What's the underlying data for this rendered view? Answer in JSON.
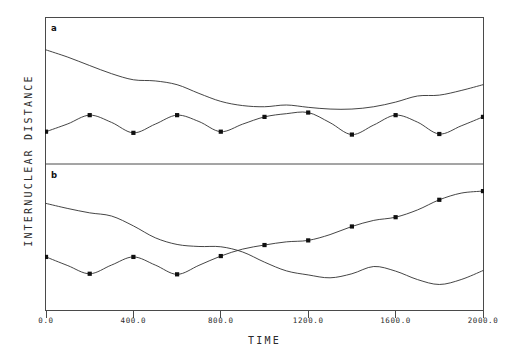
{
  "figure": {
    "background_color": "#ffffff",
    "line_color": "#303030",
    "marker_color": "#101010"
  },
  "axes": {
    "x_title": "TIME",
    "y_title": "INTERNUCLEAR DISTANCE",
    "x_tick_labels": [
      "0.0",
      "400.0",
      "800.0",
      "1200.0",
      "1600.0",
      "2000.0"
    ],
    "x_tick_values": [
      0,
      400,
      800,
      1200,
      1600,
      2000
    ],
    "y_tick_labels": []
  },
  "panels": [
    {
      "tag": "a"
    },
    {
      "tag": "b"
    }
  ],
  "chart_data": {
    "type": "line",
    "title": "",
    "xlabel": "TIME",
    "ylabel": "INTERNUCLEAR DISTANCE",
    "xlim": [
      0,
      2000
    ],
    "ylim": [
      0,
      1
    ],
    "grid": false,
    "legend": "none",
    "panel_layout": "2 stacked panels sharing one frame, divider between them",
    "marker_style": "filled square",
    "panels": [
      {
        "tag": "a",
        "series": [
          {
            "name": "panel-a-upper-curve",
            "markers": false,
            "x": [
              0,
              100,
              200,
              300,
              400,
              500,
              600,
              700,
              800,
              900,
              1000,
              1100,
              1200,
              1300,
              1400,
              1500,
              1600,
              1700,
              1800,
              1900,
              2000
            ],
            "y": [
              0.78,
              0.73,
              0.672,
              0.616,
              0.574,
              0.566,
              0.54,
              0.48,
              0.425,
              0.396,
              0.388,
              0.4,
              0.384,
              0.372,
              0.372,
              0.388,
              0.42,
              0.462,
              0.468,
              0.5,
              0.54
            ]
          },
          {
            "name": "panel-a-oscillating-curve",
            "markers": true,
            "x": [
              0,
              100,
              200,
              300,
              400,
              500,
              600,
              700,
              800,
              900,
              1000,
              1100,
              1200,
              1300,
              1400,
              1500,
              1600,
              1700,
              1800,
              1900,
              2000
            ],
            "y": [
              0.216,
              0.27,
              0.33,
              0.28,
              0.208,
              0.268,
              0.33,
              0.286,
              0.216,
              0.268,
              0.318,
              0.34,
              0.348,
              0.278,
              0.196,
              0.262,
              0.33,
              0.282,
              0.2,
              0.256,
              0.318
            ],
            "marker_x": [
              0,
              200,
              400,
              600,
              800,
              1000,
              1200,
              1400,
              1600,
              1800,
              2000
            ],
            "marker_y": [
              0.216,
              0.33,
              0.208,
              0.33,
              0.216,
              0.318,
              0.348,
              0.196,
              0.33,
              0.2,
              0.318
            ]
          }
        ]
      },
      {
        "tag": "b",
        "series": [
          {
            "name": "panel-b-descending-curve",
            "markers": false,
            "x": [
              0,
              100,
              200,
              300,
              400,
              500,
              600,
              700,
              800,
              900,
              1000,
              1100,
              1200,
              1300,
              1400,
              1500,
              1600,
              1700,
              1800,
              1900,
              2000
            ],
            "y": [
              0.735,
              0.7,
              0.67,
              0.648,
              0.58,
              0.498,
              0.452,
              0.438,
              0.436,
              0.4,
              0.33,
              0.27,
              0.242,
              0.222,
              0.25,
              0.3,
              0.268,
              0.21,
              0.176,
              0.21,
              0.272
            ]
          },
          {
            "name": "panel-b-ascending-curve",
            "markers": true,
            "x": [
              0,
              100,
              200,
              300,
              400,
              500,
              600,
              700,
              800,
              900,
              1000,
              1100,
              1200,
              1300,
              1400,
              1500,
              1600,
              1700,
              1800,
              1900,
              2000
            ],
            "y": [
              0.366,
              0.306,
              0.25,
              0.31,
              0.366,
              0.31,
              0.246,
              0.308,
              0.372,
              0.42,
              0.448,
              0.47,
              0.48,
              0.52,
              0.576,
              0.618,
              0.64,
              0.69,
              0.76,
              0.806,
              0.82
            ],
            "marker_x": [
              0,
              200,
              400,
              600,
              800,
              1000,
              1200,
              1400,
              1600,
              1800,
              2000
            ],
            "marker_y": [
              0.366,
              0.25,
              0.366,
              0.246,
              0.372,
              0.448,
              0.48,
              0.576,
              0.64,
              0.76,
              0.82
            ]
          }
        ]
      }
    ]
  }
}
